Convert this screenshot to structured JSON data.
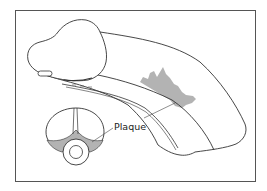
{
  "figure": {
    "type": "anatomical-illustration",
    "labels": {
      "plaque": "Plaque"
    },
    "colors": {
      "outline": "#333333",
      "plaque_fill": "#b3b3b3",
      "frame": "#555555",
      "background": "#ffffff"
    }
  }
}
